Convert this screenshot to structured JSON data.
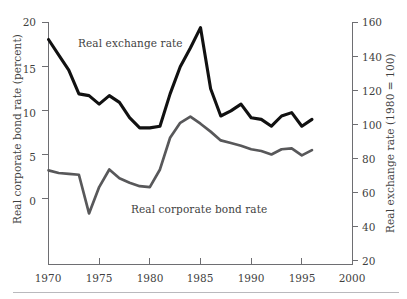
{
  "figure": {
    "top_remnant_text": "        ",
    "width": 407,
    "height": 299
  },
  "chart_data": {
    "type": "line",
    "title": "",
    "xlabel": "",
    "grid": false,
    "legend_position": "inline-annotations",
    "xlim": [
      1970,
      2000
    ],
    "x_ticks": [
      1970,
      1975,
      1980,
      1985,
      1990,
      1995,
      2000
    ],
    "axes": {
      "left": {
        "label": "Real corporate bond rate (percent)",
        "ticks": [
          0,
          5,
          10,
          15,
          20
        ],
        "lim": [
          -7.5,
          20
        ]
      },
      "right": {
        "label": "Real exchange rate (1980 = 100)",
        "ticks": [
          20,
          40,
          60,
          80,
          100,
          120,
          140,
          160
        ],
        "lim": [
          4,
          160
        ]
      }
    },
    "series": [
      {
        "name": "Real exchange rate",
        "axis": "right",
        "color": "#111111",
        "line_width": 3.1,
        "x": [
          1970,
          1971,
          1972,
          1973,
          1974,
          1975,
          1976,
          1977,
          1978,
          1979,
          1980,
          1981,
          1982,
          1983,
          1984,
          1985,
          1986,
          1987,
          1988,
          1989,
          1990,
          1991,
          1992,
          1993,
          1994,
          1995,
          1996
        ],
        "values": [
          150,
          141,
          132,
          118,
          117,
          112,
          117,
          113,
          104,
          98,
          98,
          99,
          118,
          134,
          145,
          157,
          121,
          105,
          108,
          112,
          104,
          103,
          99,
          105,
          107,
          99,
          103
        ]
      },
      {
        "name": "Real corporate bond rate",
        "axis": "left",
        "color": "#58585a",
        "line_width": 2.7,
        "x": [
          1970,
          1971,
          1972,
          1973,
          1974,
          1975,
          1976,
          1977,
          1978,
          1979,
          1980,
          1981,
          1982,
          1983,
          1984,
          1985,
          1986,
          1987,
          1988,
          1989,
          1990,
          1991,
          1992,
          1993,
          1994,
          1995,
          1996
        ],
        "values": [
          3.2,
          2.9,
          2.8,
          2.7,
          -1.7,
          1.3,
          3.3,
          2.3,
          1.8,
          1.4,
          1.3,
          3.3,
          6.9,
          8.6,
          9.3,
          8.5,
          7.6,
          6.6,
          6.3,
          6.0,
          5.6,
          5.4,
          5.0,
          5.6,
          5.7,
          4.9,
          5.5
        ]
      }
    ],
    "annotations": [
      {
        "text": "Real exchange rate",
        "x_px": 78,
        "y_px": 37
      },
      {
        "text": "Real corporate bond rate",
        "x_px": 131,
        "y_px": 203
      }
    ]
  }
}
